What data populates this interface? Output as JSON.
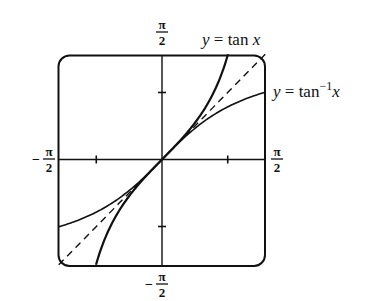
{
  "chart_data": {
    "type": "line",
    "title": "",
    "xlabel": "",
    "ylabel": "",
    "xlim": [
      "-π/2",
      "π/2"
    ],
    "ylim": [
      "-π/2",
      "π/2"
    ],
    "xlim_numeric": [
      -1.5708,
      1.5708
    ],
    "ylim_numeric": [
      -1.5708,
      1.5708
    ],
    "grid": false,
    "frame": "rounded-box",
    "tick_labels": {
      "x_left": "-π/2",
      "x_right": "π/2",
      "y_top": "π/2",
      "y_bottom": "-π/2"
    },
    "ticks": {
      "x": [
        -1,
        1
      ],
      "y": [
        -1,
        1
      ]
    },
    "series": [
      {
        "name": "y = tan x",
        "function": "tan",
        "style": "solid",
        "width": 2.2,
        "x": [
          -1.004,
          -0.8,
          -0.6,
          -0.4,
          -0.2,
          0,
          0.2,
          0.4,
          0.6,
          0.8,
          1.004
        ],
        "y": [
          -1.5708,
          -1.0296,
          -0.6841,
          -0.4228,
          -0.2027,
          0,
          0.2027,
          0.4228,
          0.6841,
          1.0296,
          1.5708
        ]
      },
      {
        "name": "y = tan⁻¹ x",
        "function": "atan",
        "style": "solid",
        "width": 1.6,
        "x": [
          -1.5708,
          -1.2,
          -0.8,
          -0.4,
          0,
          0.4,
          0.8,
          1.2,
          1.5708
        ],
        "y": [
          -1.004,
          -0.8761,
          -0.6747,
          -0.3805,
          0,
          0.3805,
          0.6747,
          0.8761,
          1.004
        ]
      },
      {
        "name": "y = x",
        "function": "identity",
        "style": "dashed",
        "width": 1.4,
        "x": [
          -1.5708,
          1.5708
        ],
        "y": [
          -1.5708,
          1.5708
        ]
      }
    ],
    "annotations": [
      {
        "text": "y = tan x",
        "near": "top, right of y-axis label"
      },
      {
        "text": "y = tan⁻¹x",
        "near": "right edge, upper"
      }
    ]
  },
  "labels": {
    "pi": "π",
    "two": "2",
    "minus": "−",
    "tan_label_y": "y",
    "tan_label_eq": " = tan ",
    "tan_label_x": "x",
    "atan_label_y": "y",
    "atan_label_eq": " = tan",
    "atan_label_sup": "−1",
    "atan_label_x": "x"
  },
  "colors": {
    "ink": "#111111",
    "background": "#ffffff"
  }
}
